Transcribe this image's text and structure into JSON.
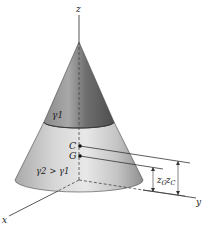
{
  "figure": {
    "width": 205,
    "height": 227,
    "axes": {
      "x_label": "x",
      "y_label": "y",
      "z_label": "z"
    },
    "regions": {
      "upper_label": "γ1",
      "lower_label": "γ2 > γ1"
    },
    "points": {
      "centroid_label": "C",
      "center_of_gravity_label": "G"
    },
    "dimensions": {
      "z_g_label": "z",
      "z_g_sub": "G",
      "z_c_label": "z",
      "z_c_sub": "C"
    },
    "colors": {
      "upper_dark": "#6a6a6a",
      "upper_light": "#b9b9b9",
      "lower_dark": "#8f8f8f",
      "lower_light": "#e2e2e2",
      "line": "#333333"
    }
  }
}
